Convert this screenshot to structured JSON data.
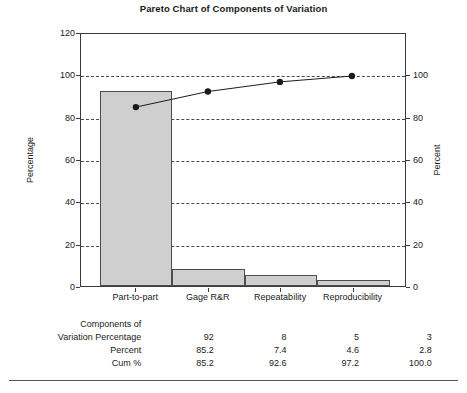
{
  "chart_data": {
    "type": "bar",
    "title": "Pareto Chart of Components of Variation",
    "xlabel": "",
    "ylabel": "Percentage",
    "y2label": "Percent",
    "categories": [
      "Part-to-part",
      "Gage R&R",
      "Repeatability",
      "Reproducibility"
    ],
    "values": [
      92,
      8,
      5,
      3
    ],
    "series": [
      {
        "name": "Percentage",
        "values": [
          92,
          8,
          5,
          3
        ]
      },
      {
        "name": "Cum %",
        "values": [
          85.2,
          92.6,
          97.2,
          100.0
        ]
      }
    ],
    "ylim": [
      0,
      120
    ],
    "y2lim": [
      0,
      100
    ],
    "yticks": [
      0,
      20,
      40,
      60,
      80,
      100,
      120
    ],
    "y2ticks": [
      0,
      20,
      40,
      60,
      80,
      100
    ],
    "grid": true,
    "grid_style": "dashed",
    "legend": "none",
    "bar_color": "#cfcfcf",
    "line_color": "#1a1a1a"
  },
  "table": {
    "row_labels": [
      "Components of\nVariation Percentage",
      "Percent",
      "Cum %"
    ],
    "row_label_line1": "Components of",
    "row_label_line2": "Variation Percentage",
    "rows": [
      {
        "label": "Variation Percentage",
        "values": [
          "92",
          "8",
          "5",
          "3"
        ]
      },
      {
        "label": "Percent",
        "values": [
          "85.2",
          "7.4",
          "4.6",
          "2.8"
        ]
      },
      {
        "label": "Cum %",
        "values": [
          "85.2",
          "92.6",
          "97.2",
          "100.0"
        ]
      }
    ]
  },
  "caption": ""
}
